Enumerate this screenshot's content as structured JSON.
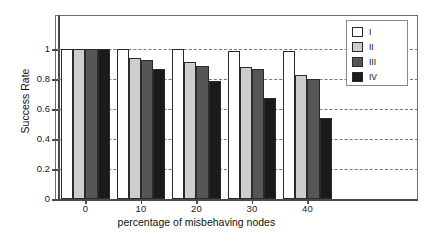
{
  "chart_data": {
    "type": "bar",
    "title": "",
    "xlabel": "percentage of misbehaving nodes",
    "ylabel": "Success Rate",
    "categories": [
      "0",
      "10",
      "20",
      "30",
      "40"
    ],
    "series": [
      {
        "name": "I",
        "color": "#ffffff",
        "values": [
          1.0,
          1.0,
          1.0,
          0.99,
          0.99
        ]
      },
      {
        "name": "II",
        "color": "#cdcdcd",
        "values": [
          1.0,
          0.94,
          0.915,
          0.88,
          0.83
        ]
      },
      {
        "name": "III",
        "color": "#565656",
        "values": [
          1.0,
          0.93,
          0.89,
          0.865,
          0.8
        ]
      },
      {
        "name": "IV",
        "color": "#1a1a1a",
        "values": [
          1.0,
          0.865,
          0.785,
          0.675,
          0.54
        ]
      }
    ],
    "ylim": [
      0,
      1.15
    ],
    "yticks": [
      0,
      0.2,
      0.4,
      0.6,
      0.8,
      1
    ],
    "ytick_labels": [
      "0",
      "0.2",
      "0.4",
      "0.6",
      "0.8",
      "1"
    ],
    "xtick_labels": [
      "0",
      "10",
      "20",
      "30",
      "40"
    ],
    "grid": "horizontal-dashed",
    "legend_position": "top-right",
    "legend_entries": [
      "I",
      "II",
      "III",
      "IV"
    ]
  }
}
